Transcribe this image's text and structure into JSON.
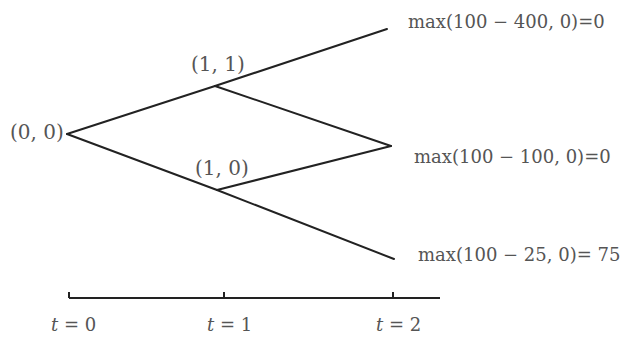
{
  "diagram": {
    "type": "binomial-tree",
    "colors": {
      "edge": "#222222",
      "text": "#555555"
    },
    "nodes": [
      {
        "id": "n00",
        "label": "(0, 0)",
        "x": 67,
        "y": 134
      },
      {
        "id": "n11",
        "label": "(1, 1)",
        "x": 215,
        "y": 86
      },
      {
        "id": "n10",
        "label": "(1, 0)",
        "x": 217,
        "y": 190
      },
      {
        "id": "n2u",
        "label": "max(100 − 400, 0)=0",
        "x": 387,
        "y": 29
      },
      {
        "id": "n2m",
        "label": "max(100 − 100, 0)=0",
        "x": 391,
        "y": 146
      },
      {
        "id": "n2d",
        "label": "max(100 − 25, 0)= 75",
        "x": 394,
        "y": 259
      }
    ],
    "edges": [
      {
        "from": "n00",
        "to": "n11"
      },
      {
        "from": "n00",
        "to": "n10"
      },
      {
        "from": "n11",
        "to": "n2u"
      },
      {
        "from": "n11",
        "to": "n2m"
      },
      {
        "from": "n10",
        "to": "n2m"
      },
      {
        "from": "n10",
        "to": "n2d"
      }
    ],
    "labels": {
      "root": "(0, 0)",
      "up": "(1, 1)",
      "down": "(1, 0)",
      "payoff_up": "max(100 − 400, 0)=0",
      "payoff_mid": "max(100 − 100, 0)=0",
      "payoff_down": "max(100 − 25, 0)= 75"
    },
    "timeline": {
      "ticks": [
        {
          "var": "t",
          "eq": " = 0",
          "x": 69
        },
        {
          "var": "t",
          "eq": " = 1",
          "x": 224
        },
        {
          "var": "t",
          "eq": " = 2",
          "x": 393
        }
      ],
      "y": 298,
      "x_start": 69,
      "x_end": 440
    }
  }
}
